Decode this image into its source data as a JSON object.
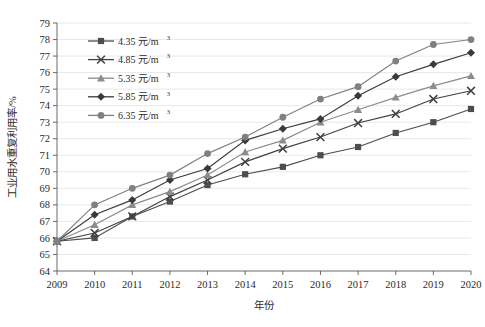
{
  "chart_data": {
    "type": "line",
    "title": "",
    "xlabel": "年份",
    "ylabel": "工业用水重复利用率/%",
    "x": [
      2009,
      2010,
      2011,
      2012,
      2013,
      2014,
      2015,
      2016,
      2017,
      2018,
      2019,
      2020
    ],
    "xticklabels": [
      "2009",
      "2010",
      "2011",
      "2012",
      "2013",
      "2014",
      "2015",
      "2016",
      "2017",
      "2018",
      "2019",
      "2020"
    ],
    "yticklabels": [
      "64",
      "65",
      "66",
      "67",
      "68",
      "69",
      "70",
      "71",
      "72",
      "73",
      "74",
      "75",
      "76",
      "77",
      "78",
      "79"
    ],
    "ylim": [
      64,
      79
    ],
    "xlim": [
      2009,
      2020
    ],
    "grid": "horizontal",
    "legend_position": "upper-left-inside",
    "series": [
      {
        "name": "4.35 元/m³",
        "label_value": "4.35",
        "label_unit": "元/m",
        "label_sup": "3",
        "marker": "square",
        "color": "#4d4d4d",
        "values": [
          65.8,
          66.0,
          67.3,
          68.2,
          69.2,
          69.85,
          70.3,
          71.0,
          71.5,
          72.35,
          73.0,
          73.8
        ]
      },
      {
        "name": "4.85 元/m³",
        "label_value": "4.85",
        "label_unit": "元/m",
        "label_sup": "3",
        "marker": "cross",
        "color": "#404040",
        "values": [
          65.8,
          66.3,
          67.3,
          68.5,
          69.5,
          70.6,
          71.4,
          72.1,
          72.95,
          73.5,
          74.4,
          74.9
        ]
      },
      {
        "name": "5.35 元/m³",
        "label_value": "5.35",
        "label_unit": "元/m",
        "label_sup": "3",
        "marker": "triangle",
        "color": "#8c8c8c",
        "values": [
          65.8,
          66.8,
          68.0,
          68.8,
          69.8,
          71.2,
          71.9,
          73.0,
          73.75,
          74.5,
          75.2,
          75.8
        ]
      },
      {
        "name": "5.85 元/m³",
        "label_value": "5.85",
        "label_unit": "元/m",
        "label_sup": "3",
        "marker": "diamond",
        "color": "#3a3a3a",
        "values": [
          65.8,
          67.4,
          68.3,
          69.5,
          70.2,
          71.9,
          72.6,
          73.2,
          74.6,
          75.75,
          76.5,
          77.2
        ]
      },
      {
        "name": "6.35 元/m³",
        "label_value": "6.35",
        "label_unit": "元/m",
        "label_sup": "3",
        "marker": "circle",
        "color": "#808080",
        "values": [
          65.8,
          68.0,
          69.0,
          69.8,
          71.1,
          72.1,
          73.3,
          74.4,
          75.15,
          76.7,
          77.7,
          78.0
        ]
      }
    ]
  }
}
